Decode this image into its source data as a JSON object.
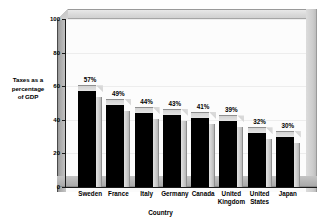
{
  "chart_data": {
    "type": "bar",
    "title": "",
    "xlabel": "Country",
    "ylabel": "Taxes as a percentage of GDP",
    "ylabel_lines": [
      "Taxes as a",
      "percentage",
      "of GDP"
    ],
    "categories": [
      "Sweden",
      "France",
      "Italy",
      "Germany",
      "Canada",
      "United Kingdom",
      "United States",
      "Japan"
    ],
    "category_lines": [
      [
        "Sweden"
      ],
      [
        "France"
      ],
      [
        "Italy"
      ],
      [
        "Germany"
      ],
      [
        "Canada"
      ],
      [
        "United",
        "Kingdom"
      ],
      [
        "United",
        "States"
      ],
      [
        "Japan"
      ]
    ],
    "values": [
      57,
      49,
      44,
      43,
      41,
      39,
      32,
      30
    ],
    "data_labels": [
      "57%",
      "49%",
      "44%",
      "43%",
      "41%",
      "39%",
      "32%",
      "30%"
    ],
    "ylim": [
      0,
      100
    ],
    "yticks": [
      0,
      20,
      40,
      60,
      80,
      100
    ],
    "ytick_labels": [
      "0",
      "20",
      "40",
      "60",
      "80",
      "100"
    ],
    "grid": true,
    "legend": "none",
    "style": "3d-bar",
    "colors": {
      "bar_front": "#000000",
      "bar_top": "#d8d8d8",
      "bar_side": "#cccccc",
      "plot_background": "#fcfcfc",
      "frame": "#cfcfcf",
      "floor": "#b4b4b4",
      "axis": "#1a1a1a",
      "gridline": "#ededed",
      "text": "#000000"
    }
  }
}
